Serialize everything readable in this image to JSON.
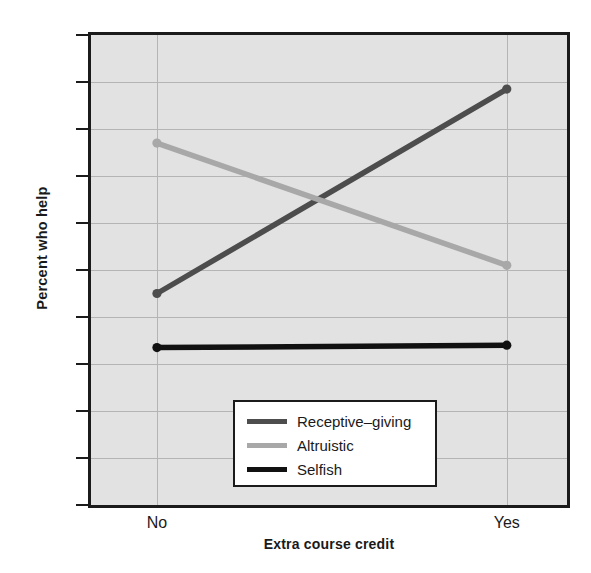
{
  "chart_data": {
    "type": "line",
    "title": "",
    "xlabel": "Extra course credit",
    "ylabel": "Percent who help",
    "categories": [
      "No",
      "Yes"
    ],
    "xticklabels": [
      "No",
      "Yes"
    ],
    "yticklabels": [
      "0",
      "10",
      "20",
      "30",
      "40",
      "50",
      "60",
      "70",
      "80",
      "90",
      "100"
    ],
    "yticks": [
      0,
      10,
      20,
      30,
      40,
      50,
      60,
      70,
      80,
      90,
      100
    ],
    "ylim": [
      0,
      100
    ],
    "grid": true,
    "legend_position": "lower center inside",
    "series": [
      {
        "name": "Receptive–giving",
        "values": [
          45,
          88.5
        ],
        "color": "#4d4d4d",
        "markers": true
      },
      {
        "name": "Altruistic",
        "values": [
          77,
          51
        ],
        "color": "#a8a8a8",
        "markers": true
      },
      {
        "name": "Selfish",
        "values": [
          33.5,
          34
        ],
        "color": "#111111",
        "markers": true
      }
    ]
  },
  "style": {
    "plot_background": "#e2e2e2",
    "page_background": "#ffffff",
    "axis_color": "#1b1b1b",
    "grid_color": "#b4b4b4",
    "legend_background": "#ffffff"
  }
}
